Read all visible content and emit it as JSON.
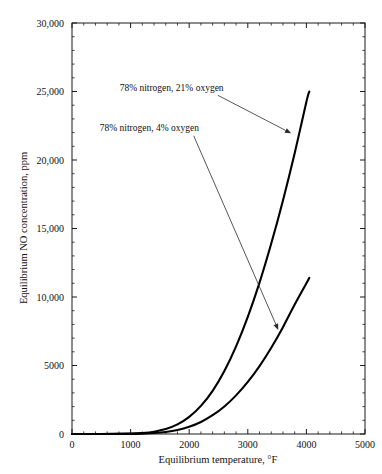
{
  "figure": {
    "background_color": "#ffffff",
    "frame_color": "#1a1a1a",
    "curve_color": "#000000",
    "text_color": "#111111",
    "watermark": ""
  },
  "chart_data": {
    "type": "line",
    "title": "",
    "xlabel": "Equilibrium temperature, °F",
    "ylabel": "Equilibrium NO concentration, ppm",
    "xlim": [
      0,
      5000
    ],
    "ylim": [
      0,
      30000
    ],
    "grid": false,
    "legend_position": "none",
    "xticks": [
      0,
      1000,
      2000,
      3000,
      4000,
      5000
    ],
    "xtick_labels": [
      "0",
      "1000",
      "2000",
      "3000",
      "4000",
      "5000"
    ],
    "x_minor_per_major": 5,
    "yticks": [
      0,
      5000,
      10000,
      15000,
      20000,
      25000,
      30000
    ],
    "ytick_labels": [
      "0",
      "5000",
      "10,000",
      "15,000",
      "20,000",
      "25,000",
      "30,000"
    ],
    "y_minor_per_major": 5,
    "series": [
      {
        "name": "78% nitrogen, 21% oxygen",
        "x": [
          0,
          500,
          1000,
          1200,
          1400,
          1600,
          1800,
          2000,
          2200,
          2400,
          2600,
          2800,
          3000,
          3200,
          3400,
          3600,
          3800,
          4000,
          4050
        ],
        "values": [
          0,
          5,
          30,
          75,
          170,
          360,
          700,
          1250,
          2050,
          3150,
          4600,
          6400,
          8550,
          11050,
          13900,
          17050,
          20500,
          24250,
          25000
        ]
      },
      {
        "name": "78% nitrogen, 4% oxygen",
        "x": [
          0,
          500,
          1000,
          1200,
          1400,
          1600,
          1800,
          2000,
          2200,
          2400,
          2600,
          2800,
          3000,
          3200,
          3400,
          3600,
          3800,
          4000,
          4050
        ],
        "values": [
          0,
          2,
          12,
          30,
          70,
          150,
          295,
          530,
          880,
          1370,
          2010,
          2820,
          3800,
          4960,
          6300,
          7800,
          9450,
          11000,
          11400
        ]
      }
    ],
    "annotations": [
      {
        "text": "78% nitrogen, 21% oxygen",
        "label_x": 1700,
        "label_y": 25050,
        "target_x": 3740,
        "target_y": 21950
      },
      {
        "text": "78% nitrogen, 4% oxygen",
        "label_x": 1320,
        "label_y": 22100,
        "target_x": 3520,
        "target_y": 7600
      }
    ]
  }
}
